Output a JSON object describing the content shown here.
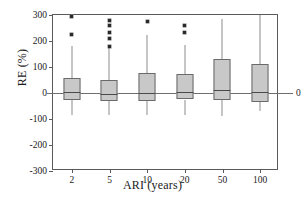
{
  "chart_data": {
    "type": "box",
    "title": "",
    "xlabel": "ARI (years)",
    "ylabel": "RE (%)",
    "categories": [
      "2",
      "5",
      "10",
      "20",
      "50",
      "100"
    ],
    "ylim": [
      -300,
      300
    ],
    "yticks": [
      300,
      200,
      100,
      0,
      -100,
      -200,
      -300
    ],
    "ytick_labels": [
      "300",
      "200",
      "100",
      "0",
      "-100",
      "-200",
      "-300"
    ],
    "xtick_labels": [
      "2",
      "5",
      "10",
      "20",
      "50",
      "100"
    ],
    "grid": false,
    "legend": null,
    "zero_reference_line": true,
    "zero_reference_label": "0",
    "box_fill_color": "#c8c8c8",
    "box_edge_color": "#6a6a6a",
    "boxes": [
      {
        "category": "2",
        "whisker_low": -86,
        "q1": -28,
        "median": 2,
        "q3": 57,
        "whisker_high": 180,
        "outliers": [
          225,
          295
        ]
      },
      {
        "category": "5",
        "whisker_low": -86,
        "q1": -30,
        "median": -5,
        "q3": 50,
        "whisker_high": 180,
        "outliers": [
          180,
          208,
          232,
          258,
          278
        ]
      },
      {
        "category": "10",
        "whisker_low": -85,
        "q1": -30,
        "median": 0,
        "q3": 78,
        "whisker_high": 223,
        "outliers": [
          275
        ]
      },
      {
        "category": "20",
        "whisker_low": -85,
        "q1": -25,
        "median": 2,
        "q3": 73,
        "whisker_high": 185,
        "outliers": [
          232,
          258
        ]
      },
      {
        "category": "50",
        "whisker_low": -88,
        "q1": -27,
        "median": 12,
        "q3": 131,
        "whisker_high": 283,
        "outliers": []
      },
      {
        "category": "100",
        "whisker_low": -70,
        "q1": -33,
        "median": 3,
        "q3": 110,
        "whisker_high": 300,
        "outliers": []
      }
    ]
  }
}
